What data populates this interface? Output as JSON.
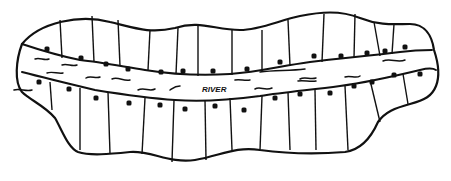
{
  "diagram": {
    "river_label": "RIVER",
    "label_pos": [
      202,
      92
    ],
    "colors": {
      "ink": "#111111",
      "background": "#ffffff"
    },
    "outline_path": "M22,44 C40,22 80,14 110,22 C135,28 150,34 175,28 C200,20 215,30 240,30 C260,30 280,20 300,16 C320,12 340,10 360,18 C380,26 395,24 410,24 C425,24 432,36 434,50 C438,62 440,76 436,86 C432,96 425,100 410,104 C395,108 385,112 378,122 C370,140 360,150 345,152 C320,154 290,154 260,150 C235,146 220,156 195,160 C170,164 150,150 130,152 C110,154 90,156 78,152 C68,148 62,130 55,118 C45,106 30,100 22,92 C14,82 16,60 22,44 Z",
    "upper_bank_path": "M22,44 C40,50 60,56 80,60 C100,62 120,66 145,70 C170,74 200,76 230,74 C260,72 280,66 310,62 C340,58 370,56 400,52 C415,50 425,50 432,50",
    "lower_bank_path": "M22,72 C45,78 70,84 95,90 C120,94 145,98 175,100 C200,102 230,100 260,96 C285,92 310,90 340,86 C370,82 395,76 420,70 C428,68 433,68 436,70",
    "top_dividers": [
      [
        60,
        20,
        62,
        58
      ],
      [
        92,
        16,
        94,
        62
      ],
      [
        118,
        20,
        120,
        66
      ],
      [
        150,
        30,
        148,
        70
      ],
      [
        178,
        28,
        176,
        74
      ],
      [
        198,
        24,
        198,
        76
      ],
      [
        232,
        30,
        232,
        75
      ],
      [
        262,
        30,
        262,
        72
      ],
      [
        288,
        20,
        290,
        66
      ],
      [
        324,
        14,
        322,
        62
      ],
      [
        355,
        14,
        354,
        58
      ],
      [
        374,
        22,
        380,
        56
      ],
      [
        394,
        24,
        392,
        54
      ]
    ],
    "bottom_dividers": [
      [
        50,
        82,
        52,
        110
      ],
      [
        80,
        88,
        80,
        150
      ],
      [
        108,
        92,
        110,
        154
      ],
      [
        145,
        98,
        142,
        154
      ],
      [
        174,
        100,
        172,
        162
      ],
      [
        205,
        100,
        206,
        160
      ],
      [
        230,
        98,
        232,
        150
      ],
      [
        262,
        96,
        260,
        150
      ],
      [
        288,
        92,
        290,
        150
      ],
      [
        315,
        90,
        316,
        150
      ],
      [
        345,
        86,
        348,
        150
      ],
      [
        370,
        80,
        380,
        122
      ],
      [
        403,
        74,
        408,
        104
      ]
    ],
    "top_dots": [
      [
        47,
        49
      ],
      [
        81,
        58
      ],
      [
        106,
        64
      ],
      [
        128,
        69
      ],
      [
        161,
        72
      ],
      [
        183,
        71
      ],
      [
        213,
        71
      ],
      [
        247,
        69
      ],
      [
        280,
        62
      ],
      [
        314,
        56
      ],
      [
        341,
        56
      ],
      [
        367,
        53
      ],
      [
        385,
        51
      ],
      [
        405,
        47
      ]
    ],
    "bottom_dots": [
      [
        39,
        82
      ],
      [
        69,
        89
      ],
      [
        96,
        98
      ],
      [
        129,
        103
      ],
      [
        160,
        105
      ],
      [
        185,
        109
      ],
      [
        215,
        106
      ],
      [
        244,
        110
      ],
      [
        275,
        98
      ],
      [
        300,
        94
      ],
      [
        330,
        93
      ],
      [
        354,
        86
      ],
      [
        372,
        82
      ],
      [
        394,
        75
      ],
      [
        420,
        74
      ]
    ],
    "waves": [
      "M35,59 C40,57 44,61 49,59",
      "M62,65 C67,63 72,67 77,65",
      "M47,73 C52,71 58,74 63,73",
      "M86,78 C90,75 96,79 100,77",
      "M112,79 C118,76 124,82 130,80",
      "M138,90 C144,87 150,92 155,89",
      "M170,90 C173,88 175,86 180,86",
      "M255,89 C260,86 265,91 272,88",
      "M300,79 C305,76 310,80 316,78",
      "M260,72 C275,70 290,71 305,69",
      "M298,81 C304,80 310,82 316,81",
      "M345,77 C350,75 356,79 360,76",
      "M383,61 C390,58 398,63 405,60",
      "M14,90 C20,88 26,92 32,90",
      "M235,80 C240,79 245,81 250,80"
    ]
  }
}
